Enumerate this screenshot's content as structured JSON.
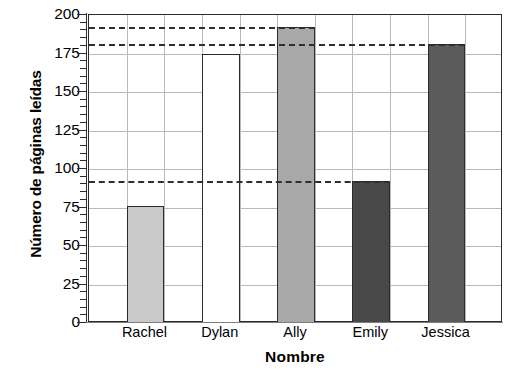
{
  "chart_data": {
    "type": "bar",
    "title": "",
    "xlabel": "Nombre",
    "ylabel": "Número de páginas leídas",
    "categories": [
      "Rachel",
      "Dylan",
      "Ally",
      "Emily",
      "Jessica"
    ],
    "values": [
      76,
      175,
      192,
      92,
      181
    ],
    "ylim": [
      0,
      200
    ],
    "ytick_labels": [
      "0",
      "25",
      "50",
      "75",
      "100",
      "125",
      "150",
      "175",
      "200"
    ],
    "ytick_values": [
      0,
      25,
      50,
      75,
      100,
      125,
      150,
      175,
      200
    ],
    "ytick_minor_step": 5,
    "grid": "both",
    "legend": "none",
    "bar_colors": [
      "#c9c9c9",
      "#ffffff",
      "#a8a8a8",
      "#484848",
      "#5a5a5a"
    ],
    "bar_edge_color": "#2b2b2b",
    "reference_lines": [
      {
        "value": 192,
        "label": "Ally",
        "style": "dashed",
        "extends_to_category": "Ally"
      },
      {
        "value": 181,
        "label": "Jessica",
        "style": "dashed",
        "extends_to_category": "Jessica"
      },
      {
        "value": 92,
        "label": "Emily",
        "style": "dashed",
        "extends_to_category": "Emily"
      }
    ],
    "vertical_gridline_count": 11,
    "axis_color": "#2b2b2b",
    "gridline_color": "#b9b9b9",
    "background": "#ffffff"
  }
}
